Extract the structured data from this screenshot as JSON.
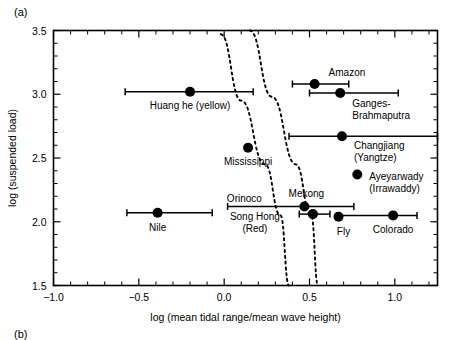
{
  "figure": {
    "panel_a_label": "(a)",
    "panel_b_label": "(b)"
  },
  "chart_data": {
    "type": "scatter",
    "title": "",
    "xlabel": "log (mean tidal range/mean wave height)",
    "ylabel": "log (suspended load)",
    "xlim": [
      -1.0,
      1.25
    ],
    "ylim": [
      1.5,
      3.5
    ],
    "xticks": [
      -1.0,
      -0.5,
      0.0,
      0.5,
      1.0
    ],
    "xtick_labels": [
      "-1.0",
      "-0.5",
      "0.0",
      "0.5",
      "1.0"
    ],
    "yticks": [
      1.5,
      2.0,
      2.5,
      3.0,
      3.5
    ],
    "ytick_labels": [
      "1.5",
      "2.0",
      "2.5",
      "3.0",
      "3.5"
    ],
    "x_minor_step": 0.1,
    "y_minor_step": 0.1,
    "grid": false,
    "legend": "none",
    "points": [
      {
        "label": "Huang he (yellow)",
        "x": -0.2,
        "y": 3.02,
        "xerr_low": -0.58,
        "xerr_high": 0.17,
        "label_dx": 0,
        "label_dy": 17,
        "anchor": "middle"
      },
      {
        "label": "Amazon",
        "x": 0.53,
        "y": 3.08,
        "xerr_low": 0.4,
        "xerr_high": 0.73,
        "label_dx": 14,
        "label_dy": -8,
        "anchor": "start"
      },
      {
        "label": "Ganges-",
        "x": 0.68,
        "y": 3.01,
        "xerr_low": 0.5,
        "xerr_high": 1.02,
        "label_dx": 12,
        "label_dy": 14,
        "anchor": "start"
      },
      {
        "label": "Brahmaputra",
        "x": null,
        "y": null,
        "xerr_low": null,
        "xerr_high": null,
        "label_dx": 12,
        "label_dy": 26,
        "anchor": "start",
        "continuation_of": "Ganges-"
      },
      {
        "label": "Changjiang",
        "x": 0.69,
        "y": 2.67,
        "xerr_low": 0.38,
        "xerr_high": 1.25,
        "label_dx": 12,
        "label_dy": 13,
        "anchor": "start"
      },
      {
        "label": "(Yangtze)",
        "x": null,
        "y": null,
        "xerr_low": null,
        "xerr_high": null,
        "label_dx": 12,
        "label_dy": 25,
        "anchor": "start",
        "continuation_of": "Changjiang"
      },
      {
        "label": "Mississippi",
        "x": 0.14,
        "y": 2.58,
        "xerr_low": null,
        "xerr_high": null,
        "label_dx": 0,
        "label_dy": 17,
        "anchor": "middle"
      },
      {
        "label": "Ayeyarwady",
        "x": 0.78,
        "y": 2.37,
        "xerr_low": null,
        "xerr_high": null,
        "label_dx": 12,
        "label_dy": 5,
        "anchor": "start"
      },
      {
        "label": "(Irrawaddy)",
        "x": null,
        "y": null,
        "xerr_low": null,
        "xerr_high": null,
        "label_dx": 12,
        "label_dy": 17,
        "anchor": "start",
        "continuation_of": "Ayeyarwady"
      },
      {
        "label": "Mekong",
        "x": 0.47,
        "y": 2.12,
        "xerr_low": 0.02,
        "xerr_high": 0.76,
        "label_dx": 2,
        "label_dy": -9,
        "anchor": "middle"
      },
      {
        "label": "Orinoco",
        "x": null,
        "y": null,
        "xerr_low": null,
        "xerr_high": null,
        "label_dx": -60,
        "label_dy": -4,
        "anchor": "middle",
        "continuation_of": "Mekong"
      },
      {
        "label": "Song Hong",
        "x": 0.52,
        "y": 2.06,
        "xerr_low": 0.44,
        "xerr_high": 0.62,
        "label_dx": -58,
        "label_dy": 6,
        "anchor": "middle"
      },
      {
        "label": "(Red)",
        "x": null,
        "y": null,
        "xerr_low": null,
        "xerr_high": null,
        "label_dx": -58,
        "label_dy": 18,
        "anchor": "middle",
        "continuation_of": "Song Hong"
      },
      {
        "label": "Fly",
        "x": 0.67,
        "y": 2.04,
        "xerr_low": null,
        "xerr_high": null,
        "label_dx": 5,
        "label_dy": 18,
        "anchor": "middle"
      },
      {
        "label": "Colorado",
        "x": 0.99,
        "y": 2.05,
        "xerr_low": 0.66,
        "xerr_high": 1.13,
        "label_dx": 0,
        "label_dy": 18,
        "anchor": "middle"
      },
      {
        "label": "Nile",
        "x": -0.39,
        "y": 2.07,
        "xerr_low": -0.57,
        "xerr_high": -0.07,
        "label_dx": 0,
        "label_dy": 18,
        "anchor": "middle"
      }
    ],
    "trend_curves": [
      {
        "name": "left-dashed-boundary",
        "points": [
          [
            -0.02,
            3.47
          ],
          [
            0.1,
            2.95
          ],
          [
            0.24,
            2.45
          ],
          [
            0.33,
            2.05
          ],
          [
            0.38,
            1.5
          ]
        ]
      },
      {
        "name": "right-dashed-boundary",
        "points": [
          [
            0.15,
            3.5
          ],
          [
            0.28,
            2.98
          ],
          [
            0.42,
            2.45
          ],
          [
            0.51,
            2.05
          ],
          [
            0.55,
            1.5
          ]
        ]
      }
    ]
  }
}
